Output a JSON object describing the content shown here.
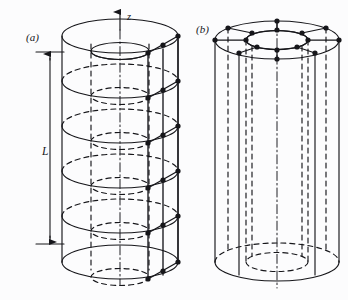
{
  "figure": {
    "title_visible": false,
    "background_color": "#fcfcfd",
    "ink_color": "#16161a",
    "panels": [
      {
        "id": "a",
        "label": "(a)",
        "label_x": 26,
        "label_y": 41,
        "description": "hollow cylinder discretized into axial layers with mesh nodes on outer surface",
        "axis": {
          "name": "z-axis",
          "label": "z",
          "label_x": 127,
          "label_y": 20,
          "arrow_tip_x": 120,
          "arrow_tip_y": 11,
          "base_y": 285
        },
        "dimension": {
          "name": "L",
          "label": "L",
          "label_x": 42,
          "label_y": 155,
          "arrow_x": 50,
          "top_y": 52,
          "bottom_y": 244,
          "tick_left": 36,
          "tick_right": 64
        },
        "geometry": {
          "center_x": 120,
          "outer_rx": 58,
          "inner_rx": 29,
          "ellipse_ry": 17,
          "inner_ry": 8.5,
          "top_y": 36,
          "bottom_y": 262,
          "layer_count": 5,
          "layer_ys": [
            36,
            81,
            126,
            171,
            216,
            262
          ]
        },
        "mesh": {
          "node_color": "#16161a",
          "node_radius": 2.6,
          "node_count": 36,
          "radial_columns": 3,
          "ring_levels": 6
        }
      },
      {
        "id": "b",
        "label": "(b)",
        "label_x": 196,
        "label_y": 33,
        "description": "hollow cylinder discretized circumferentially with nodes around annular top face and vertical element edges",
        "geometry": {
          "center_x": 277,
          "outer_rx": 62,
          "inner_rx": 31,
          "ellipse_ry": 19,
          "inner_ry": 9.5,
          "top_y": 40,
          "bottom_y": 262,
          "axis_top_y": 22,
          "axis_bottom_y": 288
        },
        "mesh": {
          "node_color": "#16161a",
          "node_radius": 2.6,
          "outer_ring_nodes": 8,
          "inner_ring_nodes": 8,
          "vertical_edges": 8
        }
      }
    ],
    "line_styles": {
      "solid": "visible edges",
      "dashed": "hidden edges",
      "dash_dot": "centre axis"
    }
  }
}
